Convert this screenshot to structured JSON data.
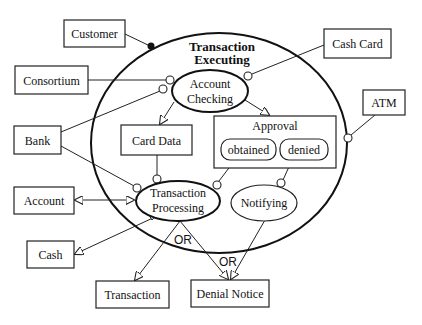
{
  "diagram": {
    "type": "object-process-diagram",
    "main_process": {
      "label_line1": "Transaction",
      "label_line2": "Executing"
    },
    "subprocesses": {
      "account_checking": {
        "line1": "Account",
        "line2": "Checking"
      },
      "transaction_processing": {
        "line1": "Transaction",
        "line2": "Processing"
      },
      "notifying": {
        "label": "Notifying"
      }
    },
    "objects": {
      "customer": "Customer",
      "consortium": "Consortium",
      "bank": "Bank",
      "cash_card": "Cash Card",
      "atm": "ATM",
      "account": "Account",
      "cash": "Cash",
      "card_data": "Card Data",
      "transaction": "Transaction",
      "denial_notice": "Denial Notice"
    },
    "approval": {
      "label": "Approval",
      "states": [
        "obtained",
        "denied"
      ]
    },
    "annotations": {
      "or_1": "OR",
      "or_2": "OR"
    },
    "links": [
      {
        "from": "Customer",
        "to": "Transaction Executing",
        "kind": "agent"
      },
      {
        "from": "Consortium",
        "to": "Account Checking",
        "kind": "instrument"
      },
      {
        "from": "Bank",
        "to": "Account Checking",
        "kind": "instrument"
      },
      {
        "from": "Bank",
        "to": "Transaction Processing",
        "kind": "instrument"
      },
      {
        "from": "Cash Card",
        "to": "Account Checking",
        "kind": "instrument"
      },
      {
        "from": "ATM",
        "to": "Transaction Executing",
        "kind": "instrument"
      },
      {
        "from": "Account Checking",
        "to": "Card Data",
        "kind": "result"
      },
      {
        "from": "Account Checking",
        "to": "Approval",
        "kind": "result"
      },
      {
        "from": "Card Data",
        "to": "Transaction Processing",
        "kind": "instrument"
      },
      {
        "from": "obtained",
        "to": "Transaction Processing",
        "kind": "instrument"
      },
      {
        "from": "denied",
        "to": "Notifying",
        "kind": "instrument"
      },
      {
        "from": "Transaction Processing",
        "to": "Account",
        "kind": "effect"
      },
      {
        "from": "Transaction Processing",
        "to": "Cash",
        "kind": "result"
      },
      {
        "from": "Transaction Processing",
        "to": "Transaction",
        "kind": "result"
      },
      {
        "from": "Transaction Processing",
        "to": "Denial Notice",
        "kind": "result"
      },
      {
        "from": "Notifying",
        "to": "Denial Notice",
        "kind": "result"
      }
    ]
  }
}
